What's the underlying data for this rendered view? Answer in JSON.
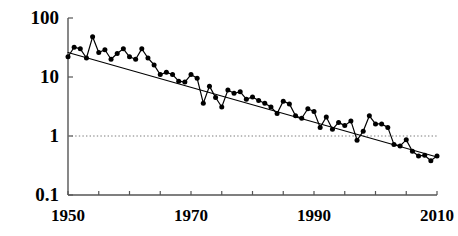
{
  "chart_data": {
    "type": "line",
    "title": "",
    "subtitle": "",
    "xlabel": "",
    "ylabel": "",
    "yscale": "log",
    "xscale": "linear",
    "xlim": [
      1950,
      2010
    ],
    "ylim": [
      0.1,
      100
    ],
    "grid": false,
    "legend": null,
    "x_ticks_labeled": [
      "1950",
      "1970",
      "1990",
      "2010"
    ],
    "x_ticks_labeled_values": [
      1950,
      1970,
      1990,
      2010
    ],
    "x_ticks_minor_values": [
      1955,
      1960,
      1965,
      1975,
      1980,
      1985,
      1995,
      2000,
      2005
    ],
    "y_ticks_labeled": [
      "100",
      "10",
      "1",
      "0.1"
    ],
    "y_ticks_labeled_values": [
      100,
      10,
      1,
      0.1
    ],
    "annotations": [
      {
        "name": "reference-line",
        "kind": "horizontal-dotted-line",
        "value": 1,
        "label": ""
      }
    ],
    "series": [
      {
        "name": "observed",
        "style": "line-with-markers",
        "marker": "filled-circle",
        "color": "#000000",
        "x": [
          1950,
          1951,
          1952,
          1953,
          1954,
          1955,
          1956,
          1957,
          1958,
          1959,
          1960,
          1961,
          1962,
          1963,
          1964,
          1965,
          1966,
          1967,
          1968,
          1969,
          1970,
          1971,
          1972,
          1973,
          1974,
          1975,
          1976,
          1977,
          1978,
          1979,
          1980,
          1981,
          1982,
          1983,
          1984,
          1985,
          1986,
          1987,
          1988,
          1989,
          1990,
          1991,
          1992,
          1993,
          1994,
          1995,
          1996,
          1997,
          1998,
          1999,
          2000,
          2001,
          2002,
          2003,
          2004,
          2005,
          2006,
          2007,
          2008,
          2009,
          2010
        ],
        "y": [
          22,
          32,
          30,
          21,
          48,
          26,
          29,
          20,
          25,
          30,
          22,
          20,
          30,
          21,
          16,
          11,
          12,
          11,
          8.5,
          8.2,
          11,
          9.5,
          3.6,
          7.0,
          4.5,
          3.1,
          6.0,
          5.3,
          5.6,
          4.2,
          4.6,
          4.0,
          3.6,
          3.1,
          2.4,
          3.9,
          3.5,
          2.2,
          2.0,
          2.9,
          2.6,
          1.4,
          2.1,
          1.3,
          1.7,
          1.5,
          1.8,
          0.85,
          1.2,
          2.2,
          1.6,
          1.6,
          1.4,
          0.72,
          0.68,
          0.86,
          0.55,
          0.46,
          0.47,
          0.38,
          0.46
        ]
      },
      {
        "name": "trend",
        "style": "line",
        "marker": "none",
        "color": "#000000",
        "x": [
          1950,
          2010
        ],
        "y": [
          26,
          0.44
        ]
      }
    ]
  },
  "axes": {
    "y_axis_name": "y-axis",
    "x_axis_name": "x-axis"
  }
}
